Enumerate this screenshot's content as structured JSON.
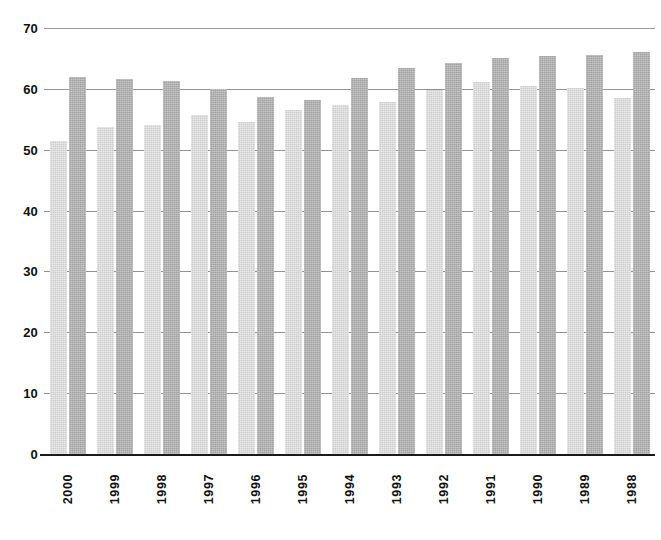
{
  "chart_data": {
    "type": "bar",
    "title": "",
    "subtitle": "",
    "xlabel": "",
    "ylabel": "",
    "ylim": [
      0,
      70
    ],
    "yticks": [
      0,
      10,
      20,
      30,
      40,
      50,
      60,
      70
    ],
    "ytick_labels": [
      "0",
      "10",
      "20",
      "30",
      "40",
      "50",
      "60",
      "70"
    ],
    "grid": "horizontal",
    "legend": "none",
    "orientation": "vertical",
    "grouping": "grouped",
    "categories": [
      "2000",
      "1999",
      "1998",
      "1997",
      "1996",
      "1995",
      "1994",
      "1993",
      "1992",
      "1991",
      "1990",
      "1989",
      "1988"
    ],
    "series": [
      {
        "name": "series-1",
        "color": "#cdcdcd",
        "values": [
          51.5,
          53.8,
          54.0,
          55.7,
          54.5,
          56.5,
          57.4,
          57.9,
          59.8,
          61.2,
          60.4,
          60.2,
          58.5
        ]
      },
      {
        "name": "series-2",
        "color": "#a2a2a2",
        "values": [
          61.9,
          61.7,
          61.3,
          59.9,
          58.7,
          58.2,
          61.8,
          63.5,
          64.2,
          65.1,
          65.4,
          65.6,
          66.1
        ]
      }
    ]
  },
  "colors": {
    "background": "#ffffff",
    "axis": "#1a1a1a",
    "gridline": "#3b3b3b",
    "series_light": "#cdcdcd",
    "series_dark": "#a2a2a2",
    "text": "#101010"
  }
}
